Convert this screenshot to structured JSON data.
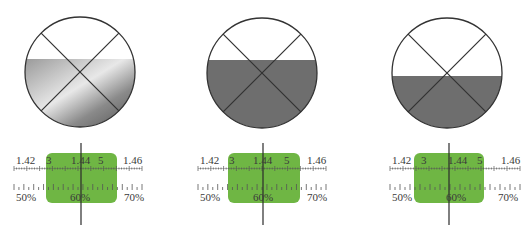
{
  "colors": {
    "circle_stroke": "#333333",
    "fill_gray": "#6e6e6e",
    "window_green": "#6fb644",
    "tick_color": "#555555"
  },
  "panels": [
    {
      "id": "left",
      "circle": {
        "cx": 80,
        "cy": 72,
        "r": 55,
        "fill_top_y": 59,
        "fill_style": "gradient"
      },
      "scale": {
        "green_box": {
          "x": 46,
          "y": 153,
          "w": 71,
          "h": 50
        },
        "crosshair_x": 81,
        "refractive_labels": [
          {
            "text": "1.42",
            "x": 16
          },
          {
            "text": "3",
            "x": 46
          },
          {
            "text": "1.44",
            "x": 71
          },
          {
            "text": "5",
            "x": 98
          },
          {
            "text": "1.46",
            "x": 123
          }
        ],
        "percent_labels": [
          {
            "text": "50%",
            "x": 16
          },
          {
            "text": "60%",
            "x": 70
          },
          {
            "text": "70%",
            "x": 124
          }
        ],
        "ruler_x_start": 14,
        "ruler_x_end": 142
      }
    },
    {
      "id": "middle",
      "circle": {
        "cx": 262,
        "cy": 73,
        "r": 55,
        "fill_top_y": 60,
        "fill_style": "solid"
      },
      "scale": {
        "green_box": {
          "x": 228,
          "y": 153,
          "w": 72,
          "h": 50
        },
        "crosshair_x": 263,
        "refractive_labels": [
          {
            "text": "1.42",
            "x": 200
          },
          {
            "text": "3",
            "x": 229
          },
          {
            "text": "1.44",
            "x": 253
          },
          {
            "text": "5",
            "x": 284
          },
          {
            "text": "1.46",
            "x": 307
          }
        ],
        "percent_labels": [
          {
            "text": "50%",
            "x": 200
          },
          {
            "text": "60%",
            "x": 253
          },
          {
            "text": "70%",
            "x": 307
          }
        ],
        "ruler_x_start": 198,
        "ruler_x_end": 326
      }
    },
    {
      "id": "right",
      "circle": {
        "cx": 447,
        "cy": 73,
        "r": 55,
        "fill_top_y": 76,
        "fill_style": "solid"
      },
      "scale": {
        "green_box": {
          "x": 414,
          "y": 153,
          "w": 70,
          "h": 50
        },
        "crosshair_x": 449,
        "refractive_labels": [
          {
            "text": "1.42",
            "x": 392
          },
          {
            "text": "3",
            "x": 421
          },
          {
            "text": "1.44",
            "x": 448
          },
          {
            "text": "5",
            "x": 477
          },
          {
            "text": "1.46",
            "x": 501
          }
        ],
        "percent_labels": [
          {
            "text": "50%",
            "x": 392
          },
          {
            "text": "60%",
            "x": 446
          },
          {
            "text": "70%",
            "x": 498
          }
        ],
        "ruler_x_start": 390,
        "ruler_x_end": 520
      }
    }
  ],
  "caption": {
    "text": ""
  }
}
